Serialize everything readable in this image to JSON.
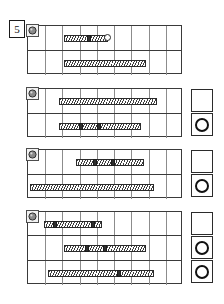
{
  "page": {
    "step_number": "5",
    "background_color": "#ffffff",
    "bar_fill_color": "#3d3d3d",
    "grid_line_color": "#3a3a3a",
    "column_line_color": "#8c8c8c",
    "ring_color": "#111111"
  },
  "legend": {
    "resource_icon": "machine-icon",
    "empty_status": "empty-box",
    "ring_status": "ring-box"
  },
  "blocks": [
    {
      "id": "block-1",
      "icon": "machine-icon",
      "x": 27,
      "y": 25,
      "width": 155,
      "height": 49,
      "columns": 9,
      "status_boxes": [],
      "rows": [
        {
          "index": 0,
          "bars": [
            {
              "left": 36,
              "width": 44,
              "caps": [
                22
              ],
              "end_dot": true
            }
          ]
        },
        {
          "index": 1,
          "bars": [
            {
              "left": 36,
              "width": 82,
              "caps": [],
              "end_dot": false
            }
          ]
        }
      ]
    },
    {
      "id": "block-2",
      "icon": "machine-icon",
      "x": 27,
      "y": 88,
      "width": 155,
      "height": 49,
      "columns": 9,
      "status_boxes": [
        {
          "row": 0,
          "type": "empty-box"
        },
        {
          "row": 1,
          "type": "ring-box"
        }
      ],
      "rows": [
        {
          "index": 0,
          "bars": [
            {
              "left": 31,
              "width": 98,
              "caps": [],
              "end_dot": false
            }
          ]
        },
        {
          "index": 1,
          "bars": [
            {
              "left": 31,
              "width": 82,
              "caps": [
                19,
                37
              ],
              "end_dot": false
            }
          ]
        }
      ]
    },
    {
      "id": "block-3",
      "icon": "machine-icon",
      "x": 27,
      "y": 149,
      "width": 155,
      "height": 49,
      "columns": 9,
      "status_boxes": [
        {
          "row": 0,
          "type": "empty-box"
        },
        {
          "row": 1,
          "type": "ring-box"
        }
      ],
      "rows": [
        {
          "index": 0,
          "bars": [
            {
              "left": 48,
              "width": 68,
              "caps": [
                16,
                34
              ],
              "end_dot": false
            }
          ]
        },
        {
          "index": 1,
          "bars": [
            {
              "left": 2,
              "width": 124,
              "caps": [],
              "end_dot": false
            }
          ]
        }
      ]
    },
    {
      "id": "block-4",
      "icon": "machine-icon",
      "x": 27,
      "y": 211,
      "width": 155,
      "height": 73,
      "columns": 9,
      "status_boxes": [
        {
          "row": 0,
          "type": "empty-box"
        },
        {
          "row": 1,
          "type": "ring-box"
        },
        {
          "row": 2,
          "type": "ring-box"
        }
      ],
      "rows": [
        {
          "index": 0,
          "bars": [
            {
              "left": 16,
              "width": 58,
              "caps": [
                8,
                46
              ],
              "end_dot": false
            }
          ]
        },
        {
          "index": 1,
          "bars": [
            {
              "left": 36,
              "width": 82,
              "caps": [
                20,
                38
              ],
              "end_dot": false
            }
          ]
        },
        {
          "index": 2,
          "bars": [
            {
              "left": 20,
              "width": 106,
              "caps": [
                68
              ],
              "end_dot": false
            }
          ]
        }
      ]
    }
  ]
}
